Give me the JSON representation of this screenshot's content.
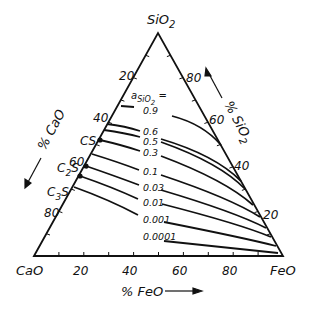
{
  "diagram": {
    "type": "ternary",
    "vertices": {
      "top": "SiO",
      "top_sub": "2",
      "left": "CaO",
      "right": "FeO"
    },
    "axes": {
      "left": {
        "label": "% CaO",
        "ticks": [
          "20",
          "40",
          "60",
          "80"
        ]
      },
      "right": {
        "label": "% SiO",
        "label_sub": "2",
        "ticks": [
          "80",
          "60",
          "40",
          "20"
        ]
      },
      "bottom": {
        "label": "% FeO",
        "ticks": [
          "20",
          "40",
          "60",
          "80"
        ]
      }
    },
    "legend_title": "a",
    "legend_title_sub": "SiO",
    "legend_title_sub2": "2",
    "legend_title_suffix": " =",
    "compounds": [
      {
        "label": "CS",
        "sub": ""
      },
      {
        "label": "C",
        "sub": "2",
        "suffix": "S"
      },
      {
        "label": "C",
        "sub": "3",
        "suffix": "S"
      }
    ],
    "isoactivity_labels": [
      "0.9",
      "0.6",
      "0.5",
      "0.3",
      "0.1",
      "0.03",
      "0.01",
      "0.001",
      "0.0001"
    ]
  }
}
